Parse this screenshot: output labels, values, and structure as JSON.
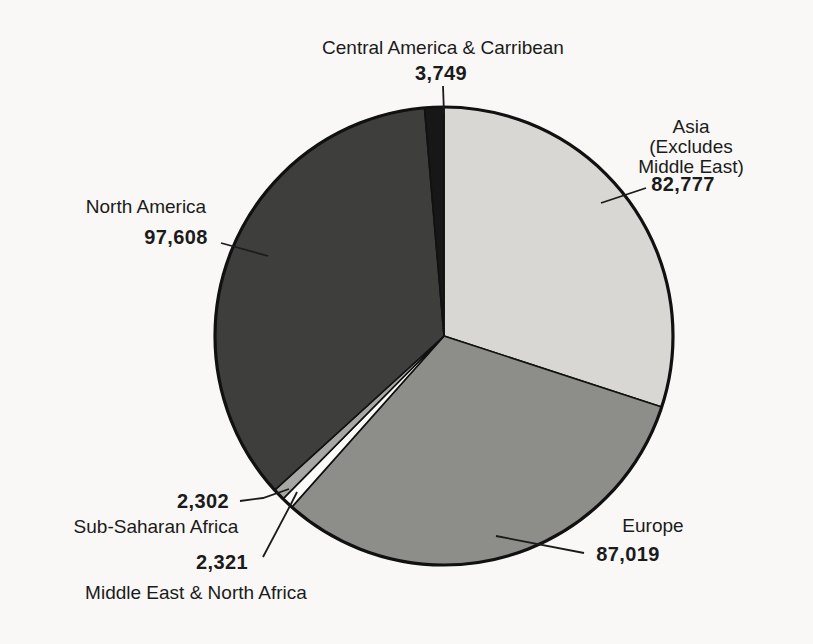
{
  "chart_data": {
    "type": "pie",
    "title": "",
    "direction": "clockwise",
    "start_angle_deg": 0,
    "total": 275776,
    "slices": [
      {
        "id": "asia",
        "label": "Asia (Excludes Middle East)",
        "value": 82777,
        "display_value": "82,777",
        "color": "#d8d7d3"
      },
      {
        "id": "europe",
        "label": "Europe",
        "value": 87019,
        "display_value": "87,019",
        "color": "#8d8d8a"
      },
      {
        "id": "mena",
        "label": "Middle East & North Africa",
        "value": 2321,
        "display_value": "2,321",
        "color": "#fbfbf9"
      },
      {
        "id": "sub_saharan",
        "label": "Sub-Saharan Africa",
        "value": 2302,
        "display_value": "2,302",
        "color": "#a7a7a4"
      },
      {
        "id": "north_america",
        "label": "North America",
        "value": 97608,
        "display_value": "97,608",
        "color": "#3e3e3d"
      },
      {
        "id": "central_america",
        "label": "Central America & Carribean",
        "value": 3749,
        "display_value": "3,749",
        "color": "#171717"
      }
    ],
    "outline_color": "#111111",
    "legend_position": "callouts"
  },
  "callouts": {
    "central_america": {
      "label": "Central America & Carribean",
      "value": "3,749"
    },
    "asia": {
      "label": "Asia (Excludes\nMiddle East)",
      "value": "82,777"
    },
    "north_america": {
      "label": "North America",
      "value": "97,608"
    },
    "europe": {
      "label": "Europe",
      "value": "87,019"
    },
    "sub_saharan": {
      "label": "Sub-Saharan Africa",
      "value": "2,302"
    },
    "mena": {
      "label": "Middle East & North Africa",
      "value": "2,321"
    }
  }
}
